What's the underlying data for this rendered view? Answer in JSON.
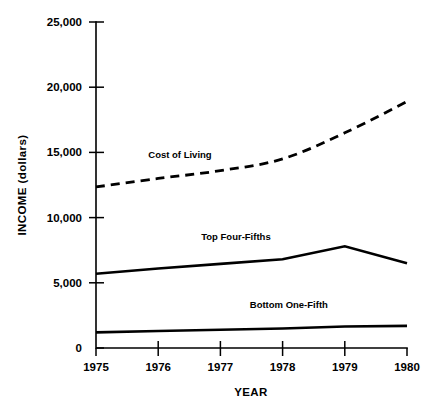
{
  "chart_data": {
    "type": "line",
    "title": "",
    "xlabel": "YEAR",
    "ylabel": "INCOME (dollars)",
    "x": [
      1975,
      1976,
      1977,
      1978,
      1979,
      1980
    ],
    "xtick_labels": [
      "1975",
      "1976",
      "1977",
      "1978",
      "1979",
      "1980"
    ],
    "ytick_labels": [
      "0",
      "5,000",
      "10,000",
      "15,000",
      "20,000",
      "25,000"
    ],
    "ytick_values": [
      0,
      5000,
      10000,
      15000,
      20000,
      25000
    ],
    "xlim": [
      1975,
      1980
    ],
    "ylim": [
      0,
      25000
    ],
    "grid": false,
    "legend": "inline-labels",
    "series": [
      {
        "name": "Cost of Living",
        "style": "dashed",
        "color": "#000000",
        "values": [
          12350,
          13000,
          13600,
          14500,
          16500,
          18900
        ]
      },
      {
        "name": "Top Four-Fifths",
        "style": "solid",
        "color": "#000000",
        "values": [
          5700,
          6100,
          6450,
          6800,
          7800,
          6500
        ]
      },
      {
        "name": "Bottom One-Fifth",
        "style": "solid",
        "color": "#000000",
        "values": [
          1200,
          1300,
          1400,
          1500,
          1650,
          1700
        ]
      }
    ],
    "annotations": [
      {
        "text": "Cost of Living",
        "x": 1976.35,
        "y": 14600
      },
      {
        "text": "Top Four-Fifths",
        "x": 1977.25,
        "y": 8300
      },
      {
        "text": "Bottom One-Fifth",
        "x": 1978.1,
        "y": 3050
      }
    ]
  },
  "axes": {
    "y_title": "INCOME (dollars)",
    "x_title": "YEAR",
    "y_ticks": [
      {
        "label": "25,000",
        "value": 25000
      },
      {
        "label": "20,000",
        "value": 20000
      },
      {
        "label": "15,000",
        "value": 15000
      },
      {
        "label": "10,000",
        "value": 10000
      },
      {
        "label": "5,000",
        "value": 5000
      },
      {
        "label": "0",
        "value": 0
      }
    ],
    "x_ticks": [
      {
        "label": "1975",
        "value": 1975
      },
      {
        "label": "1976",
        "value": 1976
      },
      {
        "label": "1977",
        "value": 1977
      },
      {
        "label": "1978",
        "value": 1978
      },
      {
        "label": "1979",
        "value": 1979
      },
      {
        "label": "1980",
        "value": 1980
      }
    ]
  },
  "style": {
    "background": "#ffffff",
    "ink": "#000000"
  }
}
